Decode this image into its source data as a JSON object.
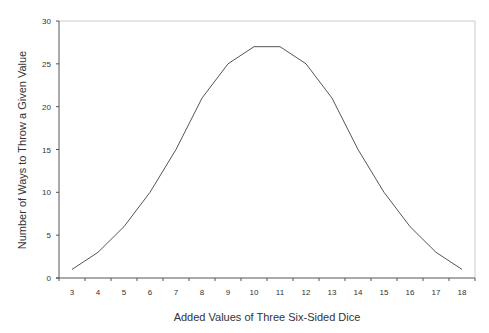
{
  "chart_data": {
    "type": "line",
    "title": "",
    "xlabel": "Added Values of Three Six-Sided Dice",
    "ylabel": "Number of Ways to Throw a Given Value",
    "categories": [
      "3",
      "4",
      "5",
      "6",
      "7",
      "8",
      "9",
      "10",
      "11",
      "12",
      "13",
      "14",
      "15",
      "16",
      "17",
      "18"
    ],
    "series": [
      {
        "name": "Ways",
        "values": [
          1,
          3,
          6,
          10,
          15,
          21,
          25,
          27,
          27,
          25,
          21,
          15,
          10,
          6,
          3,
          1
        ]
      }
    ],
    "ylim": [
      0,
      30
    ],
    "yticks": [
      0,
      5,
      10,
      15,
      20,
      25,
      30
    ],
    "grid": false,
    "legend": "none",
    "line_color": "#555555",
    "frame_color": "#cccccc",
    "axis_color": "#555555"
  }
}
